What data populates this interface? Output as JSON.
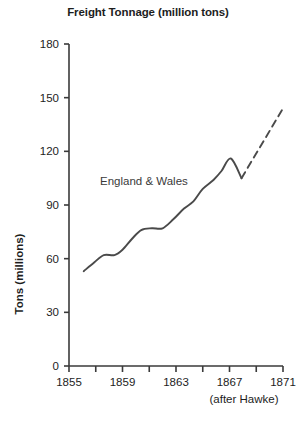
{
  "chart_data": {
    "type": "line",
    "title": "Freight Tonnage (million tons)",
    "xlabel": "",
    "ylabel": "Tons (millions)",
    "source_note": "(after Hawke)",
    "xlim": [
      1855,
      1871
    ],
    "ylim": [
      0,
      180
    ],
    "grid": false,
    "legend_position": "inline-annotation",
    "x_ticks": [
      1855,
      1857,
      1859,
      1861,
      1863,
      1865,
      1867,
      1869,
      1871
    ],
    "x_tick_labels": [
      "1855",
      "",
      "1859",
      "",
      "1863",
      "",
      "1867",
      "",
      "1871"
    ],
    "y_ticks": [
      0,
      30,
      60,
      90,
      120,
      150,
      180
    ],
    "y_tick_labels": [
      "0",
      "30",
      "60",
      "90",
      "120",
      "150",
      "180"
    ],
    "series": [
      {
        "name": "England & Wales",
        "style": "solid",
        "color": "#4a4a4a",
        "x": [
          1856.1,
          1856.9,
          1857.6,
          1858.4,
          1859.0,
          1859.7,
          1860.4,
          1861.2,
          1862.0,
          1862.8,
          1863.6,
          1864.3,
          1865.0,
          1865.8,
          1866.4,
          1867.1,
          1867.9
        ],
        "y": [
          53,
          58,
          62,
          62,
          65,
          71,
          76,
          77,
          77,
          82,
          88,
          92,
          99,
          104,
          109,
          116,
          105
        ]
      },
      {
        "name": "England & Wales (projected)",
        "style": "dashed",
        "color": "#4a4a4a",
        "x": [
          1867.9,
          1871.0
        ],
        "y": [
          105,
          144
        ]
      }
    ],
    "annotations": [
      {
        "text": "England & Wales",
        "x": 1857.5,
        "y": 105
      }
    ]
  }
}
